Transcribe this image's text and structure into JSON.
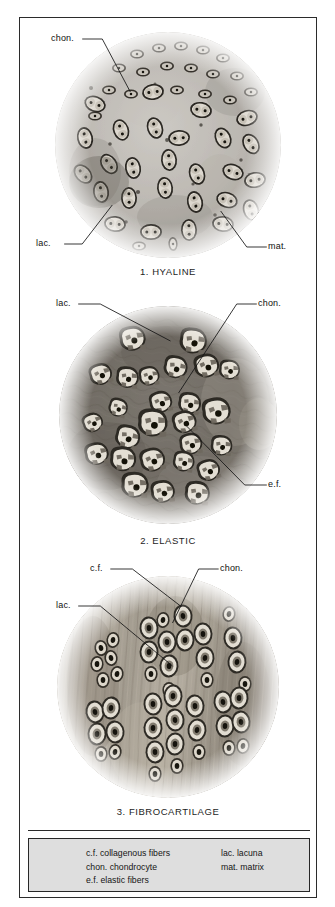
{
  "plate": {
    "title": "Types of Cartilage",
    "panels": [
      {
        "id": "hyaline",
        "caption": "1. HYALINE",
        "labels": [
          {
            "key": "chon",
            "text": "chon."
          },
          {
            "key": "lac",
            "text": "lac."
          },
          {
            "key": "mat",
            "text": "mat."
          }
        ]
      },
      {
        "id": "elastic",
        "caption": "2. ELASTIC",
        "labels": [
          {
            "key": "lac",
            "text": "lac."
          },
          {
            "key": "chon",
            "text": "chon."
          },
          {
            "key": "ef",
            "text": "e.f."
          }
        ]
      },
      {
        "id": "fibrocartilage",
        "caption": "3. FIBROCARTILAGE",
        "labels": [
          {
            "key": "cf",
            "text": "c.f."
          },
          {
            "key": "chon",
            "text": "chon."
          },
          {
            "key": "lac",
            "text": "lac."
          }
        ]
      }
    ]
  },
  "legend": {
    "left_column": [
      "c.f. collagenous fibers",
      "chon. chondrocyte",
      "e.f. elastic fibers"
    ],
    "right_column": [
      "lac. lacuna",
      "mat. matrix"
    ]
  },
  "colors": {
    "page_background": "#ffffff",
    "frame_border": "#2b2b2b",
    "legend_background": "#dedede",
    "text": "#151515",
    "leader_line": "#141414",
    "hyaline_matrix_light": "#c9c6c1",
    "hyaline_matrix_mid": "#a9a5a0",
    "elastic_matrix_dark": "#6b6761",
    "elastic_matrix_mid": "#8a857e",
    "fibro_fiber_light": "#b9b2a6",
    "fibro_fiber_dark": "#8d8478",
    "lacuna_fill": "#e6e2da",
    "cell_outline": "#2a2722",
    "nucleus": "#17150f"
  }
}
